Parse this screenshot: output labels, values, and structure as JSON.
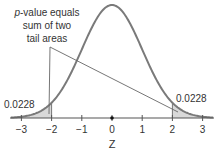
{
  "chart_data": {
    "type": "area",
    "title": "",
    "distribution": "standard normal",
    "xlabel": "Z",
    "ylabel": "",
    "xlim": [
      -3.35,
      3.35
    ],
    "x_ticks": [
      -3,
      -2,
      -1,
      0,
      1,
      2,
      3
    ],
    "x_tick_labels": [
      "−3",
      "−2",
      "−1",
      "0",
      "1",
      "2",
      "3"
    ],
    "shaded_regions": [
      {
        "name": "left tail",
        "from": -3.35,
        "to": -2,
        "area": 0.0228,
        "label": "0.0228"
      },
      {
        "name": "right tail",
        "from": 2,
        "to": 3.35,
        "area": 0.0228,
        "label": "0.0228"
      }
    ],
    "annotation": {
      "lines": [
        "p-value equals",
        "sum of two",
        "tail areas"
      ],
      "italic_prefix": "p",
      "points_to": [
        "left tail",
        "right tail"
      ]
    },
    "marker_at": 0,
    "grid": false,
    "legend": "none",
    "colors": {
      "curve": "#7a7a7a",
      "shade": "#d9d9d9",
      "axis": "#555555",
      "text": "#333333"
    }
  }
}
